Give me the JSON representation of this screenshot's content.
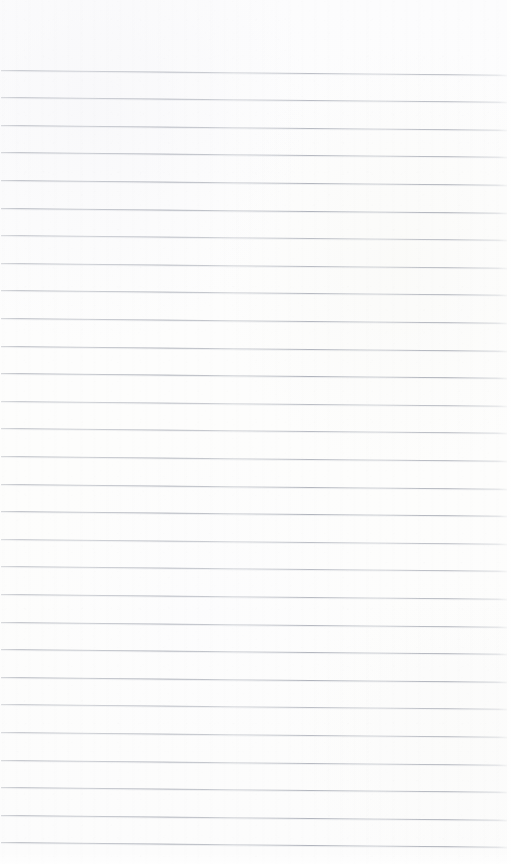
{
  "page": {
    "kind": "scanned-blank-ruled-notebook-page",
    "width": 514,
    "height": 864,
    "visible_text": "",
    "caption": "",
    "background_color": "#fdfdfd",
    "paper_tint": "#fcfcfc"
  },
  "ruling": {
    "line_color": "#a6aab3",
    "line_color_light": "#c8ccd2",
    "line_thickness_px": 1,
    "line_count": 29,
    "first_line_y": 72,
    "spacing_px": 27.6,
    "last_line_y": 844,
    "left_inset_px": 1,
    "right_inset_px": 7,
    "skew_degrees": 0.55,
    "lines_y": [
      72,
      99.6,
      127.2,
      154.8,
      182.4,
      210,
      237.6,
      265.2,
      292.8,
      320.4,
      348,
      375.6,
      403.2,
      430.8,
      458.4,
      486,
      513.6,
      541.2,
      568.8,
      596.4,
      624,
      651.6,
      679.2,
      706.8,
      734.4,
      762,
      789.6,
      817.2,
      844.8
    ]
  },
  "margins": {
    "top_blank_height_px": 66,
    "right_blank_width_px": 7,
    "left_blank_width_px": 1,
    "bottom_blank_height_px": 12
  },
  "content": {
    "handwriting": [],
    "printed_text": [],
    "annotations": [],
    "note": ""
  }
}
